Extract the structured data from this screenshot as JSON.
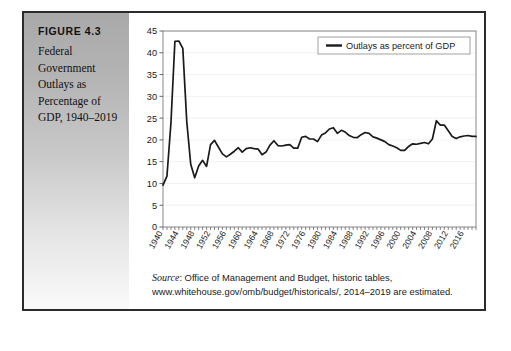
{
  "figure": {
    "number": "FIGURE 4.3",
    "title": "Federal Government Outlays as Percentage of GDP, 1940–2019"
  },
  "source": {
    "label": "Source",
    "text": ": Office of Management and Budget, historic tables, www.whitehouse.gov/omb/budget/historicals/, 2014–2019 are estimated."
  },
  "chart_data": {
    "type": "line",
    "title": "",
    "xlabel": "",
    "ylabel": "",
    "ylim": [
      0,
      45
    ],
    "yticks": [
      0,
      5,
      10,
      15,
      20,
      25,
      30,
      35,
      40,
      45
    ],
    "xlim": [
      1940,
      2019
    ],
    "xticks": [
      1940,
      1944,
      1948,
      1952,
      1956,
      1960,
      1964,
      1968,
      1972,
      1976,
      1980,
      1984,
      1988,
      1992,
      1996,
      2000,
      2004,
      2008,
      2012,
      2016
    ],
    "xtick_labels": [
      "1940",
      "1944",
      "1948",
      "1952",
      "1956",
      "1960",
      "1964",
      "1968",
      "1972",
      "1976",
      "1980",
      "1984",
      "1988",
      "1992",
      "1996",
      "2000",
      "2004",
      "2008",
      "2012",
      "2016"
    ],
    "grid": "horizontal",
    "legend_position": "top-right",
    "legend_boxed": true,
    "line_color": "#1a1a1a",
    "series": [
      {
        "name": "Outlays as percent of GDP",
        "x": [
          1940,
          1941,
          1942,
          1943,
          1944,
          1945,
          1946,
          1947,
          1948,
          1949,
          1950,
          1951,
          1952,
          1953,
          1954,
          1955,
          1956,
          1957,
          1958,
          1959,
          1960,
          1961,
          1962,
          1963,
          1964,
          1965,
          1966,
          1967,
          1968,
          1969,
          1970,
          1971,
          1972,
          1973,
          1974,
          1975,
          1976,
          1977,
          1978,
          1979,
          1980,
          1981,
          1982,
          1983,
          1984,
          1985,
          1986,
          1987,
          1988,
          1989,
          1990,
          1991,
          1992,
          1993,
          1994,
          1995,
          1996,
          1997,
          1998,
          1999,
          2000,
          2001,
          2002,
          2003,
          2004,
          2005,
          2006,
          2007,
          2008,
          2009,
          2010,
          2011,
          2012,
          2013,
          2014,
          2015,
          2016,
          2017,
          2018,
          2019
        ],
        "values": [
          9.6,
          11.7,
          23.8,
          42.6,
          42.7,
          41.0,
          24.2,
          14.4,
          11.3,
          14.0,
          15.3,
          13.9,
          18.9,
          19.9,
          18.3,
          16.8,
          16.1,
          16.7,
          17.4,
          18.2,
          17.2,
          18.0,
          18.2,
          18.0,
          17.9,
          16.6,
          17.2,
          18.8,
          19.8,
          18.7,
          18.6,
          18.8,
          18.9,
          18.1,
          18.1,
          20.6,
          20.8,
          20.2,
          20.2,
          19.6,
          21.1,
          21.6,
          22.5,
          22.8,
          21.5,
          22.2,
          21.8,
          21.0,
          20.6,
          20.5,
          21.2,
          21.7,
          21.5,
          20.7,
          20.4,
          20.0,
          19.6,
          18.9,
          18.6,
          18.2,
          17.6,
          17.6,
          18.5,
          19.1,
          19.0,
          19.2,
          19.4,
          19.1,
          20.2,
          24.4,
          23.4,
          23.4,
          22.1,
          20.8,
          20.3,
          20.7,
          20.9,
          21.0,
          20.8,
          20.8
        ]
      }
    ]
  }
}
